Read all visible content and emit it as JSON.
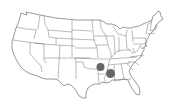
{
  "map": {
    "region": "Contiguous United States",
    "style": "state boundaries outline",
    "line_color": "#555555",
    "background": "#ffffff"
  },
  "markers": [
    {
      "name": "marker-arkansas",
      "cx": 100.5,
      "cy": 67,
      "r": 4,
      "color": "#666666"
    },
    {
      "name": "marker-mississippi",
      "cx": 110.5,
      "cy": 73.5,
      "r": 4.5,
      "color": "#666666"
    }
  ]
}
